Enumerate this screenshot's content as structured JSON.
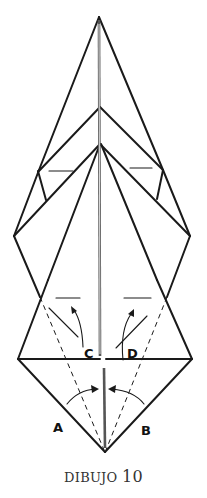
{
  "figure": {
    "caption_word": "DIBUJO",
    "caption_number": "10"
  },
  "labels": {
    "a": "A",
    "b": "B",
    "c": "C",
    "d": "D"
  },
  "colors": {
    "line": "#1a1a1a",
    "background": "#ffffff",
    "caption": "#333333"
  }
}
